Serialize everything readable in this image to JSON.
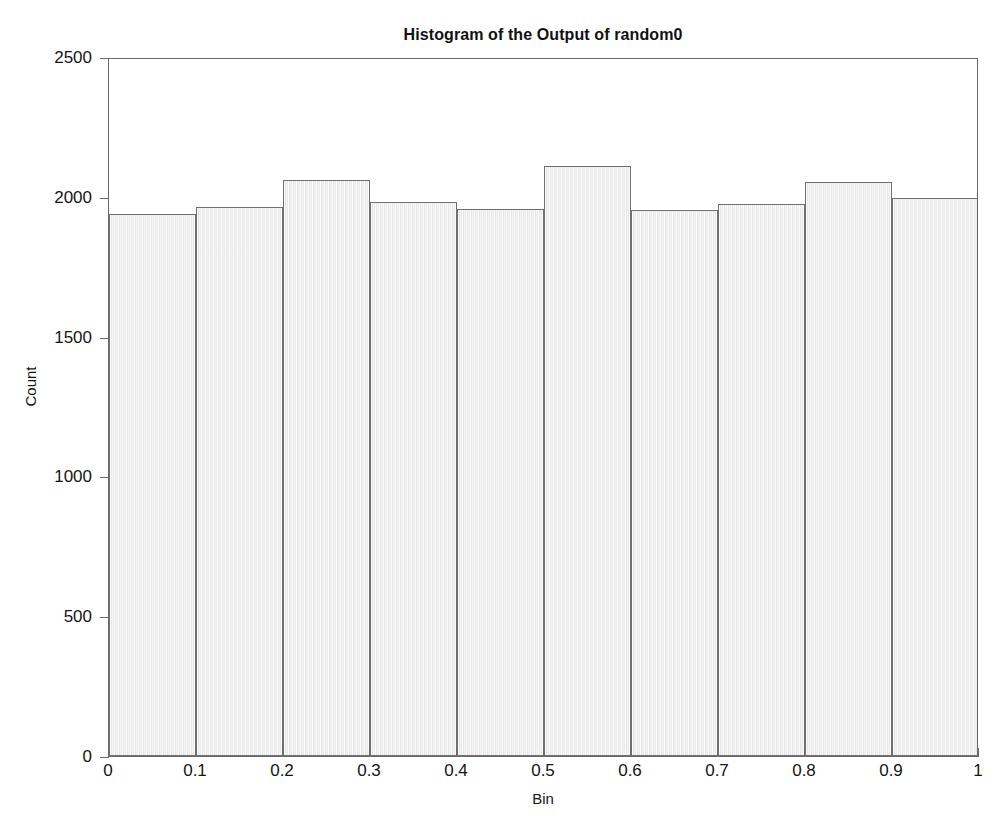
{
  "chart_data": {
    "type": "bar",
    "title": "Histogram of the Output of random0",
    "xlabel": "Bin",
    "ylabel": "Count",
    "categories": [
      "0-0.1",
      "0.1-0.2",
      "0.2-0.3",
      "0.3-0.4",
      "0.4-0.5",
      "0.5-0.6",
      "0.6-0.7",
      "0.7-0.8",
      "0.8-0.9",
      "0.9-1"
    ],
    "bin_edges": [
      0,
      0.1,
      0.2,
      0.3,
      0.4,
      0.5,
      0.6,
      0.7,
      0.8,
      0.9,
      1
    ],
    "values": [
      1940,
      1965,
      2061,
      1982,
      1958,
      2111,
      1952,
      1975,
      2053,
      1995
    ],
    "xlim": [
      0,
      1
    ],
    "ylim": [
      0,
      2500
    ],
    "xticks": [
      "0",
      "0.1",
      "0.2",
      "0.3",
      "0.4",
      "0.5",
      "0.6",
      "0.7",
      "0.8",
      "0.9",
      "1"
    ],
    "xtick_values": [
      0,
      0.1,
      0.2,
      0.3,
      0.4,
      0.5,
      0.6,
      0.7,
      0.8,
      0.9,
      1
    ],
    "yticks": [
      "0",
      "500",
      "1000",
      "1500",
      "2000",
      "2500"
    ],
    "ytick_values": [
      0,
      500,
      1000,
      1500,
      2000,
      2500
    ],
    "grid": false,
    "legend": null,
    "colors": {
      "bar_fill": "#ededed",
      "bar_edge": "#707070",
      "axis": "#6a6a6a",
      "text": "#151515",
      "background": "#ffffff"
    }
  }
}
